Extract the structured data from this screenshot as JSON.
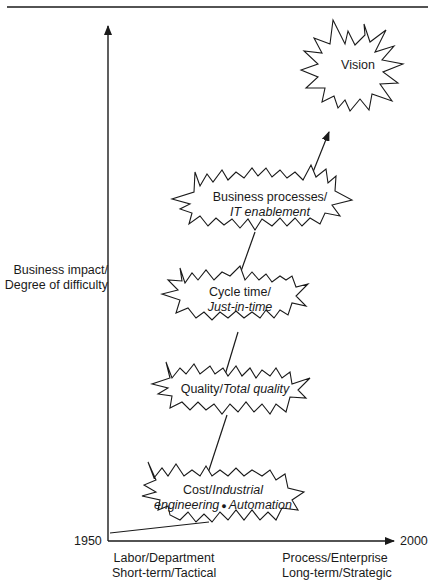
{
  "figure": {
    "y_axis_label": [
      "Business impact/",
      "Degree of difficulty"
    ],
    "x_axis": {
      "start_year": "1950",
      "end_year": "2000",
      "left_label": [
        "Labor/Department",
        "Short-term/Tactical"
      ],
      "right_label": [
        "Process/Enterprise",
        "Long-term/Strategic"
      ]
    },
    "stages": [
      {
        "name": "Cost/",
        "italic": "Industrial",
        "line2_italic": "engineering",
        "bullet": "●",
        "line2_italic_b": "Automation"
      },
      {
        "name": "Quality/",
        "italic": "Total quality"
      },
      {
        "name": "Cycle time/",
        "italic": "Just-in-time"
      },
      {
        "name": "Business processes/",
        "italic": "IT enablement"
      },
      {
        "name": "Vision"
      }
    ],
    "colors": {
      "ink": "#1a1a1a",
      "background": "#ffffff"
    }
  }
}
